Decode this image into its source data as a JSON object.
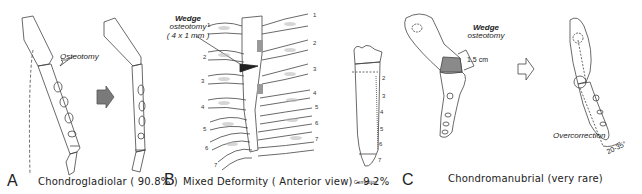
{
  "panels": {
    "A": {
      "letter": "A",
      "caption": "Chondrogladiolar  ( 90.8% )",
      "annotation": "Osteotomy"
    },
    "B": {
      "letter": "B",
      "caption": "Mixed Deformity ( Anterior view) - 9.2%",
      "annotation_line1": "Wedge",
      "annotation_line2": "osteotomy",
      "annotation_line3": "( 4 x 1 mm )",
      "rib_numbers_left": [
        "1",
        "2",
        "3",
        "4",
        "5",
        "6",
        "7"
      ],
      "rib_numbers_right": [
        "1",
        "2",
        "3",
        "4",
        "5",
        "6",
        "7"
      ],
      "correction_label": "Correction",
      "correction_numbers": [
        "2",
        "3",
        "4",
        "5",
        "6",
        "7"
      ]
    },
    "C": {
      "letter": "C",
      "caption": "Chondromanubrial  (very rare)",
      "annotation_line1": "Wedge",
      "annotation_line2": "osteotomy",
      "measurement": "1.5 cm",
      "overcorrection_label": "Overcorrection",
      "angle_label": "20-35°"
    }
  },
  "colors": {
    "line": "#444444",
    "shade": "#8a8a8a",
    "dark": "#222222",
    "arrow_fill": "#7a7a7a"
  }
}
